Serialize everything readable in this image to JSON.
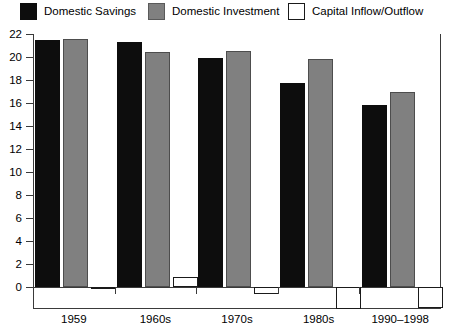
{
  "legend": {
    "items": [
      {
        "label": "Domestic Savings",
        "swatch": "black-swatch-icon",
        "color": "#0d0d0d",
        "left": 20
      },
      {
        "label": "Domestic Investment",
        "swatch": "gray-swatch-icon",
        "color": "#808080",
        "left": 148
      },
      {
        "label": "Capital Inflow/Outflow",
        "swatch": "white-swatch-icon",
        "color": "#ffffff",
        "left": 288
      }
    ]
  },
  "axis": {
    "y_ticks": [
      "22",
      "20",
      "18",
      "16",
      "14",
      "12",
      "10",
      "8",
      "6",
      "4",
      "2",
      "0"
    ],
    "y_values": [
      22,
      20,
      18,
      16,
      14,
      12,
      10,
      8,
      6,
      4,
      2,
      0
    ]
  },
  "chart_data": {
    "type": "bar",
    "title": "",
    "xlabel": "",
    "ylabel": "",
    "ylim": [
      -2,
      22
    ],
    "grid": false,
    "legend_position": "top",
    "categories": [
      "1959",
      "1960s",
      "1970s",
      "1980s",
      "1990–1998"
    ],
    "series": [
      {
        "name": "Domestic Savings",
        "color": "#0d0d0d",
        "values": [
          21.5,
          21.3,
          19.9,
          17.7,
          15.8
        ]
      },
      {
        "name": "Domestic Investment",
        "color": "#808080",
        "values": [
          21.6,
          20.4,
          20.5,
          19.8,
          17.0
        ]
      },
      {
        "name": "Capital Inflow/Outflow",
        "color": "#ffffff",
        "values": [
          0.0,
          0.9,
          -0.6,
          -1.9,
          -1.8
        ]
      }
    ]
  }
}
